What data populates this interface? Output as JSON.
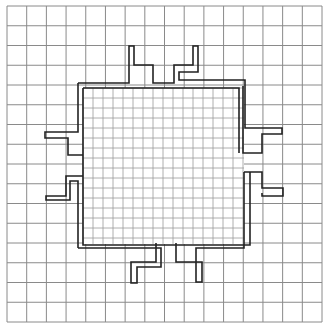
{
  "diagram": {
    "type": "grid-with-refined-region",
    "width": 331,
    "height": 330,
    "background": "#ffffff",
    "coarse_grid": {
      "x0": 7,
      "y0": 6,
      "x1": 322,
      "y1": 322,
      "cells": 16,
      "color": "#8a8a8a"
    },
    "fine_grid": {
      "x0": 83,
      "y0": 88,
      "x1": 244,
      "y1": 244,
      "spacing": 10,
      "color": "#9a9a9a"
    },
    "outline": {
      "color": "#222222",
      "notches": [
        "top-left",
        "top-right",
        "right-upper",
        "right-lower",
        "bottom-right",
        "bottom-left",
        "left-lower",
        "left-upper"
      ]
    }
  }
}
